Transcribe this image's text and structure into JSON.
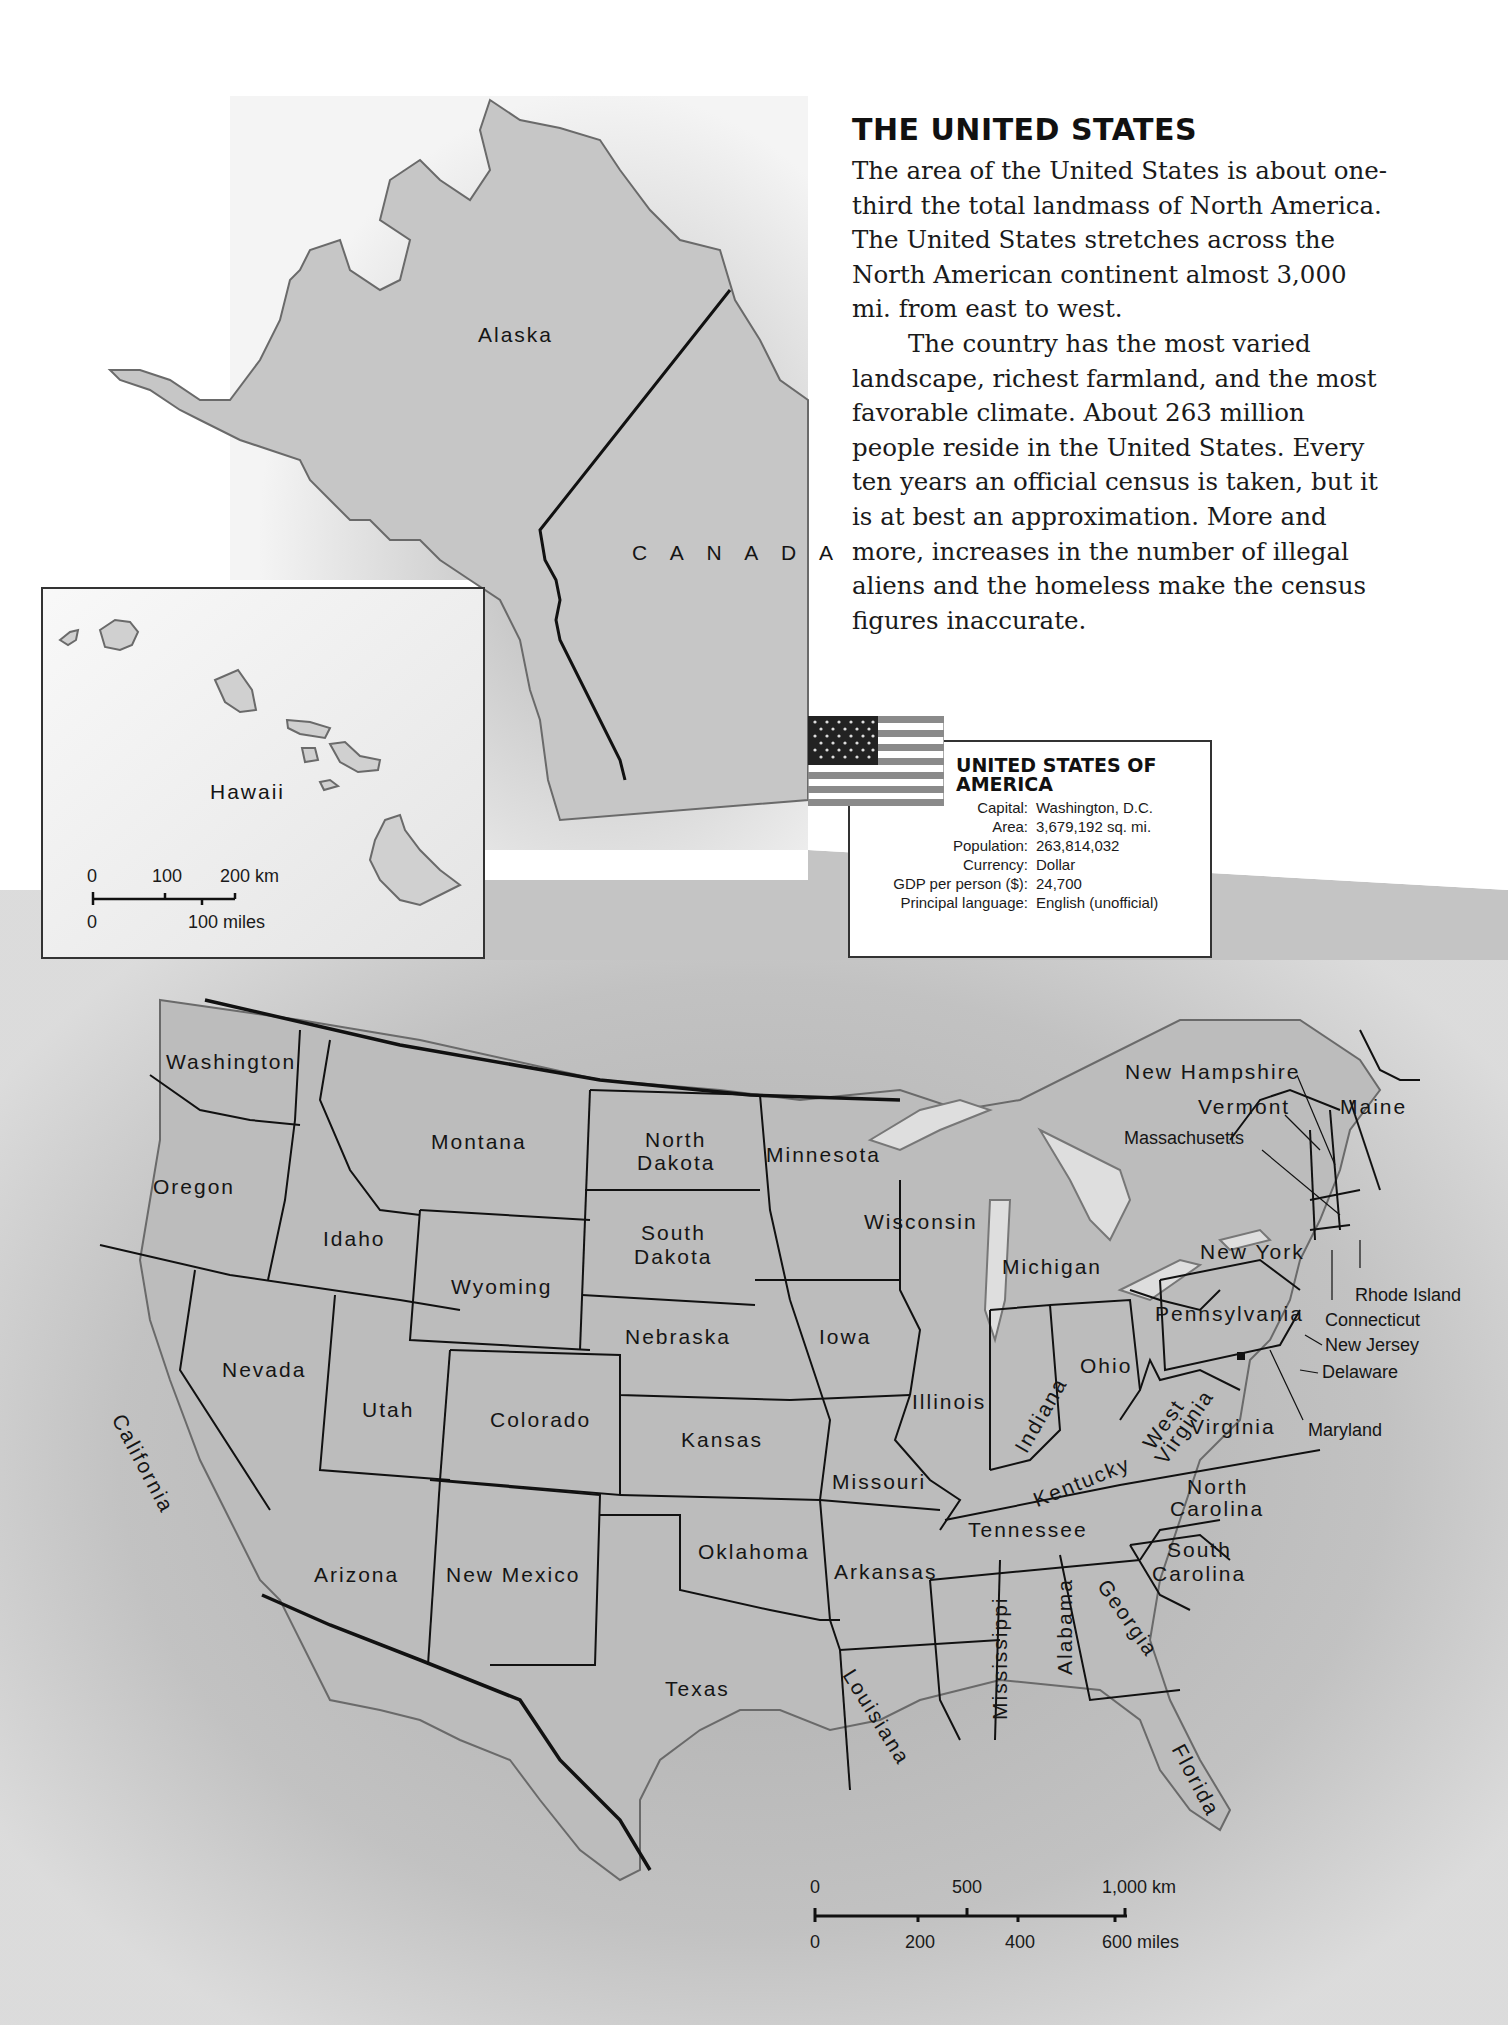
{
  "intro": {
    "title": "THE UNITED STATES",
    "paragraph_1": "The area of the United States is about one-third the total landmass of North America. The United States stretches across the North American continent almost 3,000 mi. from east to west.",
    "paragraph_2": "The country has the most varied landscape, richest farmland, and the most favorable climate. About 263 million people reside in the United States. Every ten years an official census is taken, but it is at best an approximation. More and more, increases in the number of illegal aliens and the homeless make the census figures inaccurate."
  },
  "factbox": {
    "title_line1": "UNITED STATES OF",
    "title_line2": "AMERICA",
    "rows": [
      {
        "label": "Capital:",
        "value": "Washington, D.C."
      },
      {
        "label": "Area:",
        "value": "3,679,192 sq. mi."
      },
      {
        "label": "Population:",
        "value": "263,814,032"
      },
      {
        "label": "Currency:",
        "value": "Dollar"
      },
      {
        "label": "GDP per person ($):",
        "value": "24,700"
      },
      {
        "label": "Principal language:",
        "value": "English (unofficial)"
      }
    ],
    "flag_icon": "us-flag-icon"
  },
  "map": {
    "regions": {
      "alaska": "Alaska",
      "canada": "C A N A D A",
      "hawaii": "Hawaii"
    },
    "states": {
      "washington": "Washington",
      "oregon": "Oregon",
      "california": "California",
      "idaho": "Idaho",
      "nevada": "Nevada",
      "montana": "Montana",
      "wyoming": "Wyoming",
      "utah": "Utah",
      "arizona": "Arizona",
      "colorado": "Colorado",
      "new_mexico": "New Mexico",
      "north_dakota_1": "North",
      "north_dakota_2": "Dakota",
      "south_dakota_1": "South",
      "south_dakota_2": "Dakota",
      "nebraska": "Nebraska",
      "kansas": "Kansas",
      "oklahoma": "Oklahoma",
      "texas": "Texas",
      "minnesota": "Minnesota",
      "iowa": "Iowa",
      "missouri": "Missouri",
      "arkansas": "Arkansas",
      "louisiana": "Louisiana",
      "wisconsin": "Wisconsin",
      "illinois": "Illinois",
      "michigan": "Michigan",
      "indiana": "Indiana",
      "ohio": "Ohio",
      "kentucky": "Kentucky",
      "tennessee": "Tennessee",
      "mississippi": "Mississippi",
      "alabama": "Alabama",
      "georgia": "Georgia",
      "florida": "Florida",
      "west_virginia_1": "West",
      "west_virginia_2": "Virginia",
      "virginia": "Virginia",
      "north_carolina_1": "North",
      "north_carolina_2": "Carolina",
      "south_carolina_1": "South",
      "south_carolina_2": "Carolina",
      "pennsylvania": "Pennsylvania",
      "new_york": "New York",
      "new_hampshire": "New Hampshire",
      "vermont": "Vermont",
      "maine": "Maine",
      "massachusetts": "Massachusetts",
      "rhode_island": "Rhode Island",
      "connecticut": "Connecticut",
      "new_jersey": "New Jersey",
      "delaware": "Delaware",
      "maryland": "Maryland"
    },
    "scale_main": {
      "km_0": "0",
      "km_500": "500",
      "km_1000": "1,000 km",
      "mi_0": "0",
      "mi_200": "200",
      "mi_400": "400",
      "mi_600": "600 miles"
    },
    "scale_hawaii": {
      "km_0": "0",
      "km_100": "100",
      "km_200": "200 km",
      "mi_0": "0",
      "mi_100": "100 miles"
    },
    "capital_marker": "capital-square-marker"
  }
}
